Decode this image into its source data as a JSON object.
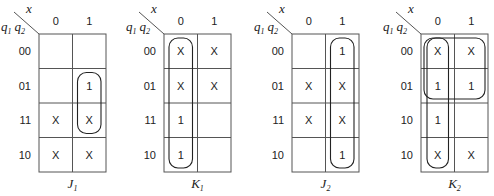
{
  "figure": {
    "corner_var_top": "x",
    "corner_var_left": [
      "q",
      "1",
      "q",
      "2"
    ],
    "column_labels": [
      "0",
      "1"
    ],
    "maps": [
      {
        "name": "J",
        "subscript": "1",
        "row_labels": [
          "00",
          "01",
          "11",
          "10"
        ],
        "cells": [
          [
            "",
            ""
          ],
          [
            "",
            "1"
          ],
          [
            "X",
            "X"
          ],
          [
            "X",
            "X"
          ]
        ],
        "loops": [
          {
            "col_start": 1,
            "col_end": 1,
            "row_start": 1,
            "row_end": 2
          }
        ]
      },
      {
        "name": "K",
        "subscript": "1",
        "row_labels": [
          "00",
          "01",
          "11",
          "10"
        ],
        "cells": [
          [
            "X",
            "X"
          ],
          [
            "X",
            "X"
          ],
          [
            "1",
            ""
          ],
          [
            "1",
            ""
          ]
        ],
        "loops": [
          {
            "col_start": 0,
            "col_end": 0,
            "row_start": 0,
            "row_end": 3
          }
        ]
      },
      {
        "name": "J",
        "subscript": "2",
        "row_labels": [
          "00",
          "01",
          "11",
          "10"
        ],
        "cells": [
          [
            "",
            "1"
          ],
          [
            "X",
            "X"
          ],
          [
            "X",
            "X"
          ],
          [
            "",
            "1"
          ]
        ],
        "loops": [
          {
            "col_start": 1,
            "col_end": 1,
            "row_start": 0,
            "row_end": 3
          }
        ]
      },
      {
        "name": "K",
        "subscript": "2",
        "row_labels": [
          "00",
          "01",
          "10",
          "10"
        ],
        "cells": [
          [
            "X",
            "X"
          ],
          [
            "1",
            "1"
          ],
          [
            "1",
            ""
          ],
          [
            "X",
            "X"
          ]
        ],
        "loops": [
          {
            "col_start": 0,
            "col_end": 1,
            "row_start": 0,
            "row_end": 1
          },
          {
            "col_start": 0,
            "col_end": 0,
            "row_start": 0,
            "row_end": 3
          }
        ]
      }
    ]
  }
}
